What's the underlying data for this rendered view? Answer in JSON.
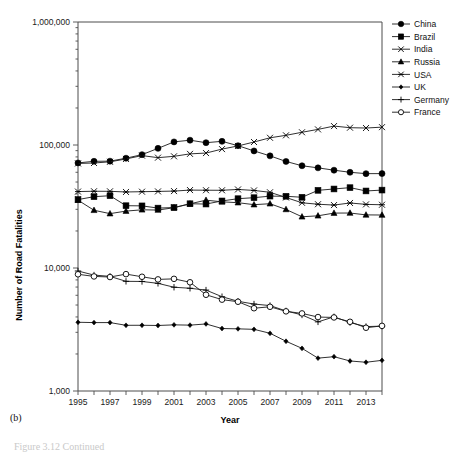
{
  "figure": {
    "panel_label": "(b)",
    "caption_partial": "Figure 3.12  Continued"
  },
  "chart_data": {
    "type": "line",
    "title": "",
    "xlabel": "Year",
    "ylabel": "Number of Road Fatalities",
    "yscale": "log",
    "ylim": [
      1000,
      1000000
    ],
    "ytick_labels": [
      "1,000",
      "10,000",
      "100,000",
      "1,000,000"
    ],
    "ytick_values": [
      1000,
      10000,
      100000,
      1000000
    ],
    "xlim": [
      1995,
      2014
    ],
    "x": [
      1995,
      1996,
      1997,
      1998,
      1999,
      2000,
      2001,
      2002,
      2003,
      2004,
      2005,
      2006,
      2007,
      2008,
      2009,
      2010,
      2011,
      2012,
      2013,
      2014
    ],
    "xtick_labels": [
      "1995",
      "1997",
      "1999",
      "2001",
      "2003",
      "2005",
      "2007",
      "2009",
      "2011",
      "2013"
    ],
    "xtick_label_values": [
      1995,
      1997,
      1999,
      2001,
      2003,
      2005,
      2007,
      2009,
      2011,
      2013
    ],
    "grid": false,
    "legend_position": "top-right",
    "series": [
      {
        "name": "China",
        "marker": "filled-circle",
        "values": [
          71500,
          73700,
          73900,
          78100,
          83500,
          93900,
          106000,
          109400,
          104400,
          107100,
          98700,
          89500,
          81600,
          73500,
          67800,
          65200,
          62400,
          59997,
          58500,
          58523
        ]
      },
      {
        "name": "Brazil",
        "marker": "filled-square",
        "values": [
          36000,
          38000,
          38700,
          32100,
          32000,
          30700,
          31000,
          33300,
          33100,
          35100,
          36600,
          37300,
          38400,
          38300,
          37600,
          42800,
          43900,
          45000,
          42300,
          43000
        ]
      },
      {
        "name": "India",
        "marker": "cross-x",
        "values": [
          70800,
          71400,
          73000,
          77000,
          82000,
          78900,
          80900,
          84700,
          85998,
          92618,
          98254,
          105749,
          114444,
          119860,
          126896,
          133938,
          142485,
          138258,
          137423,
          139671
        ]
      },
      {
        "name": "Russia",
        "marker": "filled-triangle",
        "values": [
          35599,
          29468,
          27665,
          29021,
          29718,
          29594,
          30916,
          33243,
          35602,
          34506,
          33957,
          32724,
          33308,
          29936,
          26084,
          26567,
          27953,
          27991,
          27025,
          26963
        ]
      },
      {
        "name": "USA",
        "marker": "asterisk",
        "values": [
          41817,
          42065,
          42013,
          41501,
          41717,
          41945,
          42196,
          43005,
          42884,
          42836,
          43510,
          42708,
          41259,
          37423,
          33883,
          32999,
          32479,
          33782,
          32894,
          32675
        ]
      },
      {
        "name": "UK",
        "marker": "small-diamond",
        "values": [
          3621,
          3598,
          3599,
          3421,
          3423,
          3409,
          3450,
          3431,
          3508,
          3221,
          3201,
          3172,
          2946,
          2538,
          2222,
          1850,
          1901,
          1754,
          1713,
          1775
        ]
      },
      {
        "name": "Germany",
        "marker": "plus",
        "values": [
          9454,
          8758,
          8549,
          7792,
          7772,
          7503,
          6977,
          6842,
          6613,
          5842,
          5361,
          5091,
          4949,
          4477,
          4152,
          3648,
          4009,
          3600,
          3339,
          3368
        ]
      },
      {
        "name": "France",
        "marker": "open-circle",
        "values": [
          8891,
          8541,
          8444,
          8918,
          8487,
          8079,
          8162,
          7655,
          6058,
          5530,
          5318,
          4709,
          4838,
          4443,
          4273,
          3992,
          3963,
          3653,
          3268,
          3384
        ]
      }
    ]
  },
  "legend": {
    "entries": [
      {
        "label": "China"
      },
      {
        "label": "Brazil"
      },
      {
        "label": "India"
      },
      {
        "label": "Russia"
      },
      {
        "label": "USA"
      },
      {
        "label": "UK"
      },
      {
        "label": "Germany"
      },
      {
        "label": "France"
      }
    ]
  },
  "colors": {
    "line": "#1a1a1a",
    "axis": "#4d4d4d",
    "text": "#000000",
    "background": "#ffffff"
  }
}
